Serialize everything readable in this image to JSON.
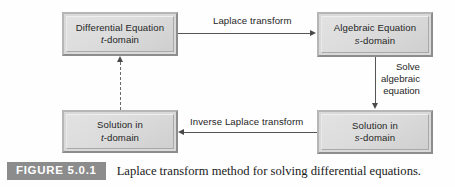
{
  "figure": {
    "badge_label": "FIGURE 5.0.1",
    "caption": "Laplace transform method for solving differential equations."
  },
  "diagram": {
    "type": "flowchart",
    "background_color": "#fefefe",
    "node_fill_color": "#d9d9d9",
    "edge_color": "#555555",
    "badge_color": "#8c8c8c",
    "nodes": [
      {
        "id": "differential-equation",
        "line1": "Differential Equation",
        "line2_var": "t",
        "line2_rest": "-domain",
        "position": "top-left"
      },
      {
        "id": "algebraic-equation",
        "line1": "Algebraic Equation",
        "line2_var": "s",
        "line2_rest": "-domain",
        "position": "top-right"
      },
      {
        "id": "solution-t-domain",
        "line1": "Solution in",
        "line2_var": "t",
        "line2_rest": "-domain",
        "position": "bottom-left"
      },
      {
        "id": "solution-s-domain",
        "line1": "Solution in",
        "line2_var": "s",
        "line2_rest": "-domain",
        "position": "bottom-right"
      }
    ],
    "edges": [
      {
        "id": "laplace-transform",
        "label": "Laplace transform",
        "from": "differential-equation",
        "to": "algebraic-equation",
        "style": "solid",
        "direction": "right"
      },
      {
        "id": "solve-algebraic-equation",
        "label_line1": "Solve",
        "label_line2": "algebraic",
        "label_line3": "equation",
        "from": "algebraic-equation",
        "to": "solution-s-domain",
        "style": "solid",
        "direction": "down"
      },
      {
        "id": "inverse-laplace-transform",
        "label": "Inverse Laplace transform",
        "from": "solution-s-domain",
        "to": "solution-t-domain",
        "style": "solid",
        "direction": "left"
      },
      {
        "id": "verification",
        "label": "",
        "from": "solution-t-domain",
        "to": "differential-equation",
        "style": "dashed",
        "direction": "up"
      }
    ]
  }
}
